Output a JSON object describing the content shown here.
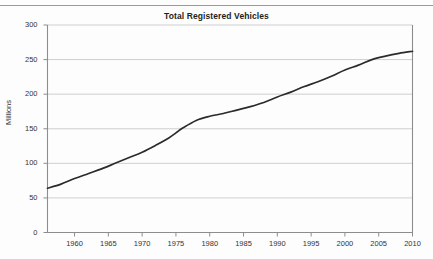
{
  "chart_data": {
    "type": "line",
    "title": "Total Registered Vehicles",
    "xlabel": "",
    "ylabel": "Millions",
    "xlim": [
      1956,
      2010
    ],
    "ylim": [
      0,
      300
    ],
    "grid": true,
    "legend": "none",
    "line_color": "#2b2b2b",
    "grid_color": "#c9c9c9",
    "axis_color": "#8d8d8d",
    "xticks": [
      1960,
      1965,
      1970,
      1975,
      1980,
      1985,
      1990,
      1995,
      2000,
      2005,
      2010
    ],
    "xtick_labels": [
      "1960",
      "1965",
      "1970",
      "1975",
      "1980",
      "1985",
      "1990",
      "1995",
      "2000",
      "2005",
      "2010"
    ],
    "yticks": [
      0,
      50,
      100,
      150,
      200,
      250,
      300
    ],
    "ytick_labels": [
      "0",
      "50",
      "100",
      "150",
      "200",
      "250",
      "300"
    ],
    "series": [
      {
        "name": "Total Registered Vehicles",
        "x": [
          1956,
          1958,
          1960,
          1962,
          1964,
          1966,
          1968,
          1970,
          1972,
          1974,
          1975,
          1976,
          1978,
          1980,
          1982,
          1984,
          1986,
          1988,
          1990,
          1992,
          1994,
          1996,
          1998,
          2000,
          2002,
          2004,
          2006,
          2008,
          2010
        ],
        "values": [
          64,
          70,
          78,
          85,
          92,
          100,
          108,
          116,
          126,
          137,
          144,
          151,
          162,
          168,
          172,
          177,
          182,
          188,
          196,
          203,
          211,
          218,
          226,
          235,
          242,
          250,
          255,
          259,
          262
        ],
        "units": "millions"
      }
    ]
  }
}
